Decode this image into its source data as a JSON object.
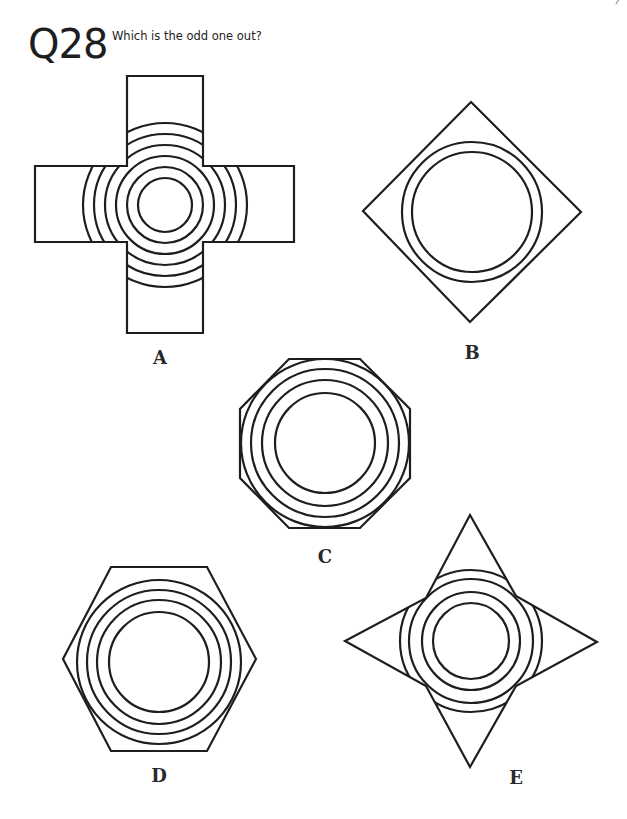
{
  "page": {
    "number": "7"
  },
  "question": {
    "number": "Q28",
    "prompt": "Which is the odd one out?"
  },
  "options": [
    {
      "label": "A",
      "shape": "cross",
      "concentric_circles": 6
    },
    {
      "label": "B",
      "shape": "diamond",
      "concentric_circles": 2
    },
    {
      "label": "C",
      "shape": "octagon",
      "concentric_circles": 4
    },
    {
      "label": "D",
      "shape": "hexagon",
      "concentric_circles": 4
    },
    {
      "label": "E",
      "shape": "four-pointed-star",
      "concentric_circles": 4
    }
  ],
  "style": {
    "stroke": "#1e1e1e",
    "background": "#ffffff"
  }
}
